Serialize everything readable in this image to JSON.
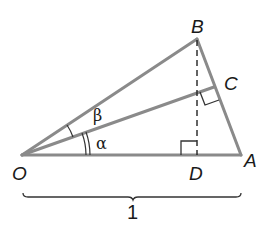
{
  "diagram": {
    "type": "geometry",
    "colors": {
      "line": "#8a8a8a",
      "text": "#1a1a1a",
      "background": "#ffffff"
    },
    "points": {
      "O": {
        "label": "O",
        "x": 22,
        "y": 155
      },
      "A": {
        "label": "A",
        "x": 241,
        "y": 155
      },
      "B": {
        "label": "B",
        "x": 197,
        "y": 39
      },
      "C": {
        "label": "C",
        "x": 214,
        "y": 88
      },
      "D": {
        "label": "D",
        "x": 197,
        "y": 155
      }
    },
    "angles": {
      "alpha": {
        "label": "α",
        "between": [
          "OA",
          "OC"
        ],
        "marks": 2
      },
      "beta": {
        "label": "β",
        "between": [
          "OC",
          "OB"
        ],
        "marks": 1
      }
    },
    "right_angles": [
      "D",
      "C"
    ],
    "segments": [
      "OA",
      "OB",
      "AB",
      "OC",
      "BD (dashed)"
    ],
    "brace": {
      "from": "O",
      "to": "A",
      "label": "1"
    }
  }
}
